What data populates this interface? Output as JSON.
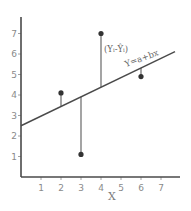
{
  "chart_data": {
    "type": "scatter",
    "title": "",
    "xlabel": "X",
    "ylabel": "",
    "xlim": [
      0,
      7.8
    ],
    "ylim": [
      0,
      7.7
    ],
    "grid": false,
    "x_ticks": [
      1,
      2,
      3,
      4,
      5,
      6,
      7
    ],
    "y_ticks": [
      1,
      2,
      3,
      4,
      5,
      6,
      7
    ],
    "series": [
      {
        "name": "observations",
        "points": [
          {
            "x": 2,
            "y": 4.1
          },
          {
            "x": 3,
            "y": 1.1
          },
          {
            "x": 4,
            "y": 7.0
          },
          {
            "x": 6,
            "y": 4.9
          }
        ]
      }
    ],
    "regression_line": {
      "label": "Y=a+bx",
      "intercept": 2.5,
      "slope": 0.47,
      "x_range": [
        0,
        7.7
      ]
    },
    "annotations": [
      {
        "text": "(Yᵢ-Ŷᵢ)",
        "target": "residual at x=4"
      },
      {
        "text": "Y=a+bx",
        "target": "regression line"
      }
    ],
    "residuals_shown": true
  },
  "labels": {
    "x_axis": "X",
    "residual_annotation": "(Yᵢ-Ŷᵢ)",
    "line_annotation": "Y=a+bx",
    "x_tick_labels": [
      "1",
      "2",
      "3",
      "4",
      "5",
      "6",
      "7"
    ],
    "y_tick_labels": [
      "1",
      "2",
      "3",
      "4",
      "5",
      "6",
      "7"
    ]
  }
}
